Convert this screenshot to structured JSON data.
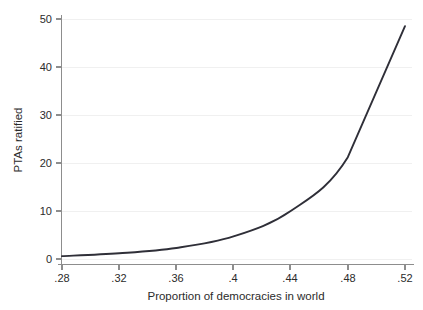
{
  "chart_data": {
    "type": "line",
    "title": "",
    "subtitle": "",
    "xlabel": "Proportion of democracies in world",
    "ylabel": "PTAs ratified",
    "x": [
      0.28,
      0.32,
      0.36,
      0.4,
      0.44,
      0.48,
      0.52
    ],
    "values": [
      0.6,
      1.2,
      2.3,
      4.7,
      10.0,
      21.2,
      48.5
    ],
    "series": [
      {
        "name": "PTAs ratified",
        "values": [
          0.6,
          1.2,
          2.3,
          4.7,
          10.0,
          21.2,
          48.5
        ],
        "color": "#2f2f38"
      }
    ],
    "xlim": [
      0.28,
      0.52
    ],
    "ylim": [
      0,
      50
    ],
    "xticks": [
      0.28,
      0.32,
      0.36,
      0.4,
      0.44,
      0.48,
      0.52
    ],
    "xtick_labels": [
      ".28",
      ".32",
      ".36",
      ".4",
      ".44",
      ".48",
      ".52"
    ],
    "yticks": [
      0,
      10,
      20,
      30,
      40,
      50
    ],
    "ytick_labels": [
      "0",
      "10",
      "20",
      "30",
      "40",
      "50"
    ],
    "grid": "horizontal",
    "grid_color": "#f0f0f0",
    "legend": "none",
    "background": "#ffffff",
    "axis_color": "#8d8d8d",
    "line_color": "#2f2f38"
  },
  "axes": {
    "x_title": "Proportion of democracies in world",
    "y_title": "PTAs ratified"
  },
  "yticks": {
    "t0": "0",
    "t1": "10",
    "t2": "20",
    "t3": "30",
    "t4": "40",
    "t5": "50"
  },
  "xticks": {
    "t0": ".28",
    "t1": ".32",
    "t2": ".36",
    "t3": ".4",
    "t4": ".44",
    "t5": ".48",
    "t6": ".52"
  }
}
